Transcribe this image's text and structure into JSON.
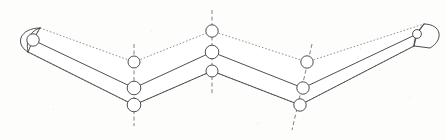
{
  "figure": {
    "background_color": "#fdfdfc",
    "solid_line_color": "#3b3b42",
    "hidden_line_color": "#6e6e78",
    "axis_line_color": "#55555f",
    "circle_fill_color": "#ffffff",
    "canvas": {
      "width": 445,
      "height": 140
    }
  },
  "geometry": {
    "top_solid_path": "M 33 40 L 134 88 L 212 52 L 303 88 L 417 34",
    "lower_solid_path": "M 28 52 L 134 105 L 212 71 L 300 105 L 414 46",
    "upper_hidden_path": "M 40 28 L 134 62 L 212 31 L 307 62 L 424 24",
    "left_cap_top_edge": "M 33 40 L 40 28",
    "left_cap_bottom_edge": "M 28 52 L 33 40",
    "left_cap_arc": "M 40 28 C 20 28 14 44 28 52",
    "left_cap_inner_arc": "M 40 28 C 28 32 26 42 28 52",
    "right_cap_top_edge": "M 417 34 L 424 24",
    "right_cap_bottom_edge": "M 414 46 L 417 34",
    "right_cap_arc": "M 424 24 C 442 24 444 40 430 48 L 414 46",
    "right_cap_inner_arc": "M 424 24 C 418 30 414 38 414 46",
    "hidden_cross_left": "M 40 28 L 33 40",
    "hidden_long_upper_left": "M 40 28 L 134 62",
    "hidden_long_upper_right": "M 307 62 L 424 24",
    "hidden_mid_left": "M 134 62 L 212 31",
    "hidden_mid_right": "M 212 31 L 307 62",
    "hidden_lower_left": "M 28 52 L 134 105",
    "hidden_lower_right": "M 300 105 L 414 46"
  },
  "center_axes": [
    {
      "name": "left-knuckle-axis",
      "path": "M 134 44 L 134 126"
    },
    {
      "name": "center-apex-axis",
      "path": "M 212 10 L 212 94"
    },
    {
      "name": "right-knuckle-axis",
      "path": "M 312 44 L 292 130"
    }
  ],
  "pivots": [
    {
      "name": "left-end-pin",
      "cx": 33,
      "cy": 40,
      "r": 6.2
    },
    {
      "name": "left-knuckle-upper-pin",
      "cx": 134,
      "cy": 62,
      "r": 6.0
    },
    {
      "name": "left-knuckle-middle-pin",
      "cx": 134,
      "cy": 88,
      "r": 6.8
    },
    {
      "name": "left-knuckle-lower-pin",
      "cx": 134,
      "cy": 105,
      "r": 6.8
    },
    {
      "name": "center-apex-upper-pin",
      "cx": 212,
      "cy": 31,
      "r": 6.2
    },
    {
      "name": "center-apex-middle-pin",
      "cx": 212,
      "cy": 52,
      "r": 6.8
    },
    {
      "name": "center-apex-lower-pin",
      "cx": 212,
      "cy": 71,
      "r": 6.0
    },
    {
      "name": "right-knuckle-upper-pin",
      "cx": 307,
      "cy": 62,
      "r": 6.2
    },
    {
      "name": "right-knuckle-middle-pin",
      "cx": 303,
      "cy": 88,
      "r": 6.2
    },
    {
      "name": "right-knuckle-lower-pin",
      "cx": 300,
      "cy": 105,
      "r": 6.2
    },
    {
      "name": "right-end-pin",
      "cx": 417,
      "cy": 34,
      "r": 4.4
    }
  ]
}
